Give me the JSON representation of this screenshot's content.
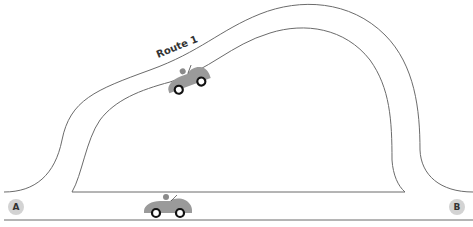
{
  "diagram": {
    "route_label": "Route 1",
    "nodes": [
      {
        "id": "A",
        "label": "A"
      },
      {
        "id": "B",
        "label": "B"
      }
    ],
    "colors": {
      "road_line": "#6b6b6b",
      "node_fill": "#d3d3d3",
      "car_body": "#9a9a9a",
      "wheel": "#111111",
      "text": "#333333"
    },
    "icons": [
      "car-icon",
      "car-icon"
    ]
  }
}
